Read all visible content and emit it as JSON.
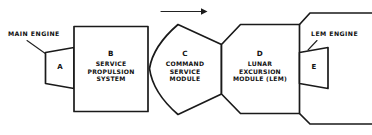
{
  "diagram": {
    "background_color": "#ffffff",
    "line_color": "#1a1a1a",
    "direction_arrow": {
      "name": "direction-of-travel-arrow",
      "points_to": "right"
    },
    "callouts": [
      {
        "id": "main-engine",
        "text": "MAIN ENGINE",
        "target": "A"
      },
      {
        "id": "lem-engine",
        "text": "LEM ENGINE",
        "target": "E"
      }
    ],
    "modules": [
      {
        "id": "A",
        "code": "A",
        "shape": "trapezoid-nozzle",
        "lines": []
      },
      {
        "id": "B",
        "code": "B",
        "shape": "rectangle",
        "lines": [
          "SERVICE",
          "PROPULSION",
          "SYSTEM"
        ]
      },
      {
        "id": "C",
        "code": "C",
        "shape": "capsule-cone",
        "lines": [
          "COMMAND",
          "SERVICE",
          "MODULE"
        ]
      },
      {
        "id": "D",
        "code": "D",
        "shape": "clipped-rectangle",
        "lines": [
          "LUNAR",
          "EXCURSION",
          "MODULE (LEM)"
        ]
      },
      {
        "id": "E",
        "code": "E",
        "shape": "trapezoid-nozzle",
        "lines": []
      }
    ]
  }
}
